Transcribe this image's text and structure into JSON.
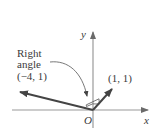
{
  "diagram": {
    "type": "vector-diagram",
    "axes": {
      "x_label": "x",
      "y_label": "y",
      "origin_label": "O"
    },
    "vectors": [
      {
        "name": "vector-neg4-1",
        "label": "(−4, 1)",
        "components": [
          -4,
          1
        ]
      },
      {
        "name": "vector-1-1",
        "label": "(1, 1)",
        "components": [
          1,
          1
        ]
      }
    ],
    "annotation": {
      "line1": "Right",
      "line2": "angle"
    },
    "colors": {
      "axis": "#8a8a8a",
      "vector": "#4a4a4a",
      "text": "#3a3a3a",
      "background": "#ffffff"
    }
  }
}
